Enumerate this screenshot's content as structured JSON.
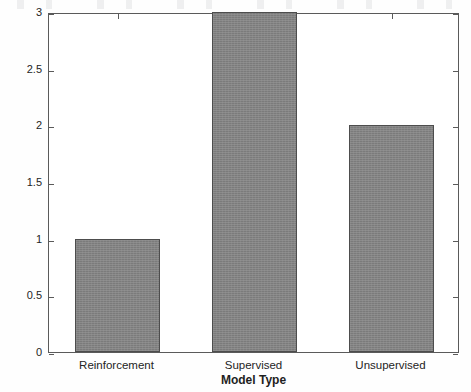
{
  "chart_data": {
    "type": "bar",
    "title": "",
    "xlabel": "Model Type",
    "ylabel": "Applications in AI Security",
    "categories": [
      "Reinforcement",
      "Supervised",
      "Unsupervised"
    ],
    "values": [
      1,
      3,
      2
    ],
    "ylim": [
      0,
      3
    ],
    "yticks": [
      "0",
      "0.5",
      "1",
      "1.5",
      "2",
      "2.5",
      "3"
    ],
    "ytick_values": [
      0,
      0.5,
      1,
      1.5,
      2,
      2.5,
      3
    ],
    "grid": false,
    "legend": null,
    "bar_color": "#838383",
    "bar_edge_color": "#4d4d4d",
    "axis_color": "#5a5a5a",
    "background": "#ffffff"
  },
  "figure": {
    "style_note": "scanned grayscale bar chart"
  }
}
